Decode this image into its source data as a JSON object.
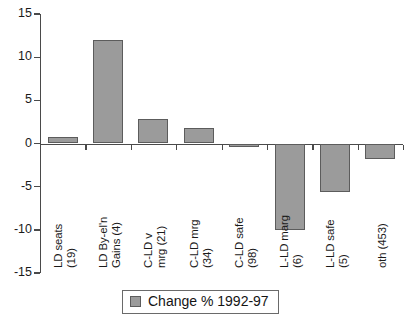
{
  "chart_data": {
    "type": "bar",
    "title": "",
    "xlabel": "",
    "ylabel": "",
    "ylim": [
      -15,
      15
    ],
    "yticks": [
      15,
      10,
      5,
      0,
      -5,
      -10,
      -15
    ],
    "ytick_labels": [
      "15",
      "10",
      "5",
      "0",
      "-5",
      "-10",
      "-15"
    ],
    "grid": false,
    "legend_position": "bottom-center",
    "categories": [
      "LD seats (19)",
      "LD By-el'n Gains (4)",
      "C-LD v mrg (21)",
      "C-LD mrg (34)",
      "C-LD safe (98)",
      "L-LD marg (6)",
      "L-LD safe (5)",
      "oth (453)"
    ],
    "category_lines": [
      [
        "LD seats",
        "(19)"
      ],
      [
        "LD By-el'n",
        "Gains (4)"
      ],
      [
        "C-LD v",
        "mrg (21)"
      ],
      [
        "C-LD mrg",
        "(34)"
      ],
      [
        "C-LD safe",
        "(98)"
      ],
      [
        "L-LD marg",
        "(6)"
      ],
      [
        "L-LD safe",
        "(5)"
      ],
      [
        "oth (453)"
      ]
    ],
    "series": [
      {
        "name": "Change % 1992-97",
        "values": [
          0.75,
          12.0,
          2.85,
          1.8,
          -0.4,
          -10.0,
          -5.6,
          -1.8
        ],
        "color": "#9b9b9b"
      }
    ]
  },
  "legend": {
    "entries": [
      {
        "label": "Change % 1992-97",
        "swatch_color": "#9b9b9b"
      }
    ]
  },
  "axis": {
    "y_min_label": "-15",
    "y_max_label": "15",
    "zero_label": "0"
  }
}
